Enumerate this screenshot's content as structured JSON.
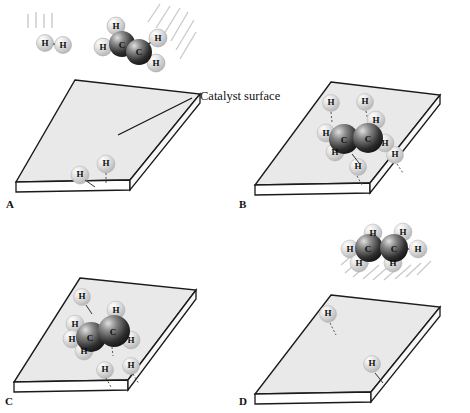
{
  "figure": {
    "annotation": "Catalyst surface",
    "atom_labels": {
      "hydrogen": "H",
      "carbon": "C"
    },
    "colors": {
      "slab_top": "#e9e9e9",
      "slab_front": "#ffffff",
      "slab_edge": "#1a1a1a",
      "carbon_dark": "#262626",
      "carbon_light": "#b8b8b8",
      "hydrogen": "#d8d8d8",
      "hatch": "#c9c9c9",
      "text": "#111111"
    },
    "panels": [
      {
        "id": "A",
        "label": "A",
        "caption_visible": false,
        "gas_phase": [
          {
            "species": "H2",
            "atoms": [
              "H",
              "H"
            ]
          },
          {
            "species": "C2H4",
            "atoms": [
              "C",
              "C",
              "H",
              "H",
              "H",
              "H"
            ],
            "bond": "double"
          }
        ],
        "adsorbed_hydrogens": 2,
        "adsorbed_molecule": null,
        "motion_lines": [
          "vertical",
          "diagonal"
        ],
        "has_annotation": true
      },
      {
        "id": "B",
        "label": "B",
        "caption_visible": false,
        "gas_phase": [],
        "adsorbed_hydrogens": 4,
        "adsorbed_molecule": {
          "species": "C2H4",
          "atoms": [
            "C",
            "C",
            "H",
            "H",
            "H",
            "H"
          ],
          "bond": "single"
        },
        "motion_lines": [],
        "has_annotation": false
      },
      {
        "id": "C",
        "label": "C",
        "caption_visible": false,
        "gas_phase": [],
        "adsorbed_hydrogens": 3,
        "adsorbed_molecule": {
          "species": "C2H5",
          "atoms": [
            "C",
            "C",
            "H",
            "H",
            "H",
            "H",
            "H"
          ],
          "bond": "single"
        },
        "motion_lines": [],
        "has_annotation": false
      },
      {
        "id": "D",
        "label": "D",
        "caption_visible": false,
        "gas_phase": [
          {
            "species": "C2H6",
            "atoms": [
              "C",
              "C",
              "H",
              "H",
              "H",
              "H",
              "H",
              "H"
            ],
            "bond": "single"
          }
        ],
        "adsorbed_hydrogens": 2,
        "adsorbed_molecule": null,
        "motion_lines": [
          "diagonal"
        ],
        "has_annotation": false
      }
    ]
  }
}
